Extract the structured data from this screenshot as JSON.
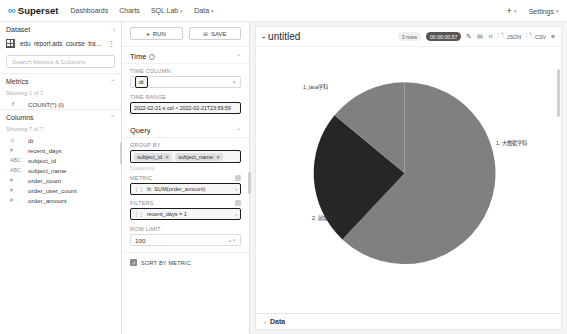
{
  "navbar": {
    "brand": "Superset",
    "brand_mark": "∞",
    "links": [
      {
        "label": "Dashboards",
        "caret": ""
      },
      {
        "label": "Charts",
        "caret": ""
      },
      {
        "label": "SQL Lab",
        "caret": "▾"
      },
      {
        "label": "Data",
        "caret": "▾"
      }
    ],
    "plus": "+",
    "plus_caret": "▾",
    "settings": "Settings",
    "settings_caret": "▾"
  },
  "dataset_panel": {
    "header": "Dataset",
    "collapse_icon": "⊣",
    "dataset_name": "edu_report.ads_course_trad...",
    "kebab": "⋮",
    "search_placeholder": "Search Metrics & Columns",
    "metrics": {
      "title": "Metrics",
      "chevron": "⌃",
      "showing": "Showing 1 of 1",
      "items": [
        {
          "type": "f",
          "name": "COUNT(*) (l)"
        }
      ]
    },
    "columns": {
      "title": "Columns",
      "chevron": "⌃",
      "showing": "Showing 7 of 7",
      "items": [
        {
          "type": "◷",
          "name": "dt"
        },
        {
          "type": "#",
          "name": "recent_days"
        },
        {
          "type": "ABC",
          "name": "subject_id"
        },
        {
          "type": "ABC",
          "name": "subject_name"
        },
        {
          "type": "#",
          "name": "order_count"
        },
        {
          "type": "#",
          "name": "order_user_count"
        },
        {
          "type": "#",
          "name": "order_amount"
        }
      ]
    }
  },
  "control_panel": {
    "run_label": "RUN",
    "run_icon": "▸",
    "save_label": "SAVE",
    "save_icon": "⊞",
    "time_section": {
      "title": "Time",
      "info": "i",
      "chevron": "⌃",
      "time_column_label": "TIME COLUMN",
      "time_column_value": "dt",
      "time_range_label": "TIME RANGE",
      "time_range_value": "2022-02-21 ≤ col < 2022-02-21T23:59:59"
    },
    "query_section": {
      "title": "Query",
      "chevron": "⌃",
      "group_by_label": "GROUP BY",
      "group_by_tags": [
        "subject_id",
        "subject_name"
      ],
      "tag_remove": "✕",
      "group_by_hint": "5 option(s)",
      "metric_label": "METRIC",
      "metric_value": "SUM(order_amount)",
      "metric_prefix": "fx",
      "filters_label": "FILTERS",
      "filters_value": "recent_days = 1",
      "row_limit_label": "ROW LIMIT",
      "row_limit_value": "100",
      "sort_by_metric_label": "SORT BY METRIC",
      "sort_by_metric_checked": "✓"
    }
  },
  "chart_header": {
    "title": "- untitled",
    "rows_badge": "3 rows",
    "time_badge": "00:00:00.57",
    "actions": [
      {
        "name": "edit-properties",
        "glyph": "✎",
        "label": ""
      },
      {
        "name": "email",
        "glyph": "✉",
        "label": ""
      },
      {
        "name": "embed-code",
        "glyph": "‹›",
        "label": ""
      },
      {
        "name": "download-json",
        "glyph": "🗋",
        "label": ".JSON"
      },
      {
        "name": "download-csv",
        "glyph": "🗋",
        "label": ".CSV"
      },
      {
        "name": "more-menu",
        "glyph": "≡",
        "label": ""
      }
    ]
  },
  "data_panel": {
    "chevron": "›",
    "label": "Data"
  },
  "chart_data": {
    "type": "pie",
    "title": "- untitled",
    "metric": "SUM(order_amount)",
    "group_by": [
      "subject_id",
      "subject_name"
    ],
    "legend": "none",
    "slices": [
      {
        "label": "1, 大数据学科",
        "value": 62,
        "color": "#808080",
        "label_x": 493,
        "label_y": 152
      },
      {
        "label": "2, 前端学科",
        "value": 24,
        "color": "#262626",
        "label_x": 311,
        "label_y": 227
      },
      {
        "label": "1, java学科",
        "value": 14,
        "color": "#808080",
        "label_x": 302,
        "label_y": 96
      }
    ],
    "colors": [
      "#808080",
      "#262626"
    ],
    "center_x": 388,
    "center_y": 180,
    "radius": 75
  }
}
